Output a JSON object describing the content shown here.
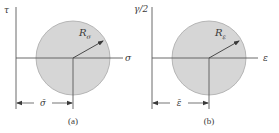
{
  "colors": {
    "fill": "#d6d6d6",
    "stroke": "#9a9a9a",
    "axis": "#6e6e6e",
    "text": "#3a3a3a"
  },
  "panels": [
    {
      "caption": "(a)",
      "y_axis_label": "τ",
      "x_axis_label": "σ",
      "radius_label": "R",
      "radius_subscript": "σ",
      "center_label": "σ̄"
    },
    {
      "caption": "(b)",
      "y_axis_label": "γ/2",
      "x_axis_label": "ε",
      "radius_label": "R",
      "radius_subscript": "ε",
      "center_label": "ε̄"
    }
  ]
}
